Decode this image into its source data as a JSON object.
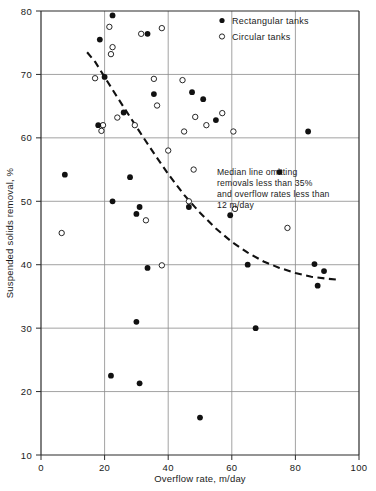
{
  "chart_data": {
    "type": "scatter",
    "title": "",
    "xlabel": "Overflow rate, m/day",
    "ylabel": "Suspended solids removal, %",
    "xlim": [
      0,
      100
    ],
    "ylim": [
      10,
      80
    ],
    "xticks": [
      0,
      20,
      40,
      60,
      80,
      100
    ],
    "yticks": [
      10,
      20,
      30,
      40,
      50,
      60,
      70,
      80
    ],
    "xtick_labels": [
      "0",
      "20",
      "40",
      "60",
      "80",
      "100"
    ],
    "ytick_labels": [
      "10",
      "20",
      "30",
      "40",
      "50",
      "60",
      "70",
      "80"
    ],
    "grid": true,
    "legend_position": "top-right",
    "series": [
      {
        "name": "Rectangular tanks",
        "marker": "filled-circle",
        "color": "#111111",
        "points": [
          [
            22.5,
            79.3
          ],
          [
            18.5,
            75.5
          ],
          [
            33.5,
            76.4
          ],
          [
            20.0,
            69.6
          ],
          [
            35.5,
            66.9
          ],
          [
            47.5,
            67.2
          ],
          [
            51.0,
            66.1
          ],
          [
            26.0,
            64.0
          ],
          [
            18.0,
            62.0
          ],
          [
            55.0,
            62.8
          ],
          [
            84.0,
            61.0
          ],
          [
            7.5,
            54.2
          ],
          [
            28.0,
            53.8
          ],
          [
            75.0,
            54.6
          ],
          [
            22.5,
            50.0
          ],
          [
            46.5,
            49.1
          ],
          [
            31.0,
            49.1
          ],
          [
            30.0,
            48.0
          ],
          [
            59.5,
            47.8
          ],
          [
            86.0,
            40.1
          ],
          [
            65.0,
            40.0
          ],
          [
            33.5,
            39.5
          ],
          [
            89.0,
            39.0
          ],
          [
            87.0,
            36.7
          ],
          [
            30.0,
            31.0
          ],
          [
            67.5,
            30.0
          ],
          [
            22.0,
            22.5
          ],
          [
            31.0,
            21.3
          ],
          [
            50.0,
            15.9
          ]
        ]
      },
      {
        "name": "Circular tanks",
        "marker": "open-circle",
        "color": "#111111",
        "points": [
          [
            21.5,
            77.5
          ],
          [
            38.0,
            77.3
          ],
          [
            31.5,
            76.4
          ],
          [
            22.5,
            74.3
          ],
          [
            22.0,
            73.2
          ],
          [
            17.0,
            69.4
          ],
          [
            35.5,
            69.3
          ],
          [
            44.5,
            69.1
          ],
          [
            36.5,
            65.1
          ],
          [
            24.0,
            63.2
          ],
          [
            48.5,
            63.3
          ],
          [
            57.0,
            63.9
          ],
          [
            19.5,
            62.0
          ],
          [
            29.5,
            62.0
          ],
          [
            52.0,
            62.0
          ],
          [
            45.0,
            61.0
          ],
          [
            60.5,
            61.0
          ],
          [
            19.0,
            61.1
          ],
          [
            40.0,
            58.0
          ],
          [
            48.0,
            55.0
          ],
          [
            46.5,
            50.0
          ],
          [
            61.0,
            48.8
          ],
          [
            33.0,
            47.0
          ],
          [
            77.5,
            45.8
          ],
          [
            6.5,
            45.0
          ],
          [
            38.0,
            39.9
          ]
        ]
      }
    ],
    "median_line": {
      "label": "Median line",
      "style": "dashed",
      "points": [
        [
          14.5,
          73.5
        ],
        [
          17.0,
          72.0
        ],
        [
          20.0,
          69.6
        ],
        [
          24.0,
          66.4
        ],
        [
          28.0,
          63.3
        ],
        [
          32.0,
          60.2
        ],
        [
          36.0,
          57.2
        ],
        [
          40.0,
          54.3
        ],
        [
          45.0,
          51.0
        ],
        [
          50.0,
          48.2
        ],
        [
          55.0,
          45.7
        ],
        [
          60.0,
          43.6
        ],
        [
          65.0,
          41.9
        ],
        [
          70.0,
          40.5
        ],
        [
          75.0,
          39.5
        ],
        [
          80.0,
          38.7
        ],
        [
          85.0,
          38.1
        ],
        [
          90.0,
          37.8
        ],
        [
          94.0,
          37.6
        ]
      ]
    },
    "annotation": {
      "lines": [
        "Median line omitting",
        "removals less than 35%",
        "and overflow rates less than",
        "12 m/day"
      ],
      "x": 60,
      "y": 55
    }
  },
  "legend": {
    "entries": [
      {
        "label": "Rectangular tanks",
        "marker": "filled-circle"
      },
      {
        "label": "Circular tanks",
        "marker": "open-circle"
      }
    ]
  }
}
